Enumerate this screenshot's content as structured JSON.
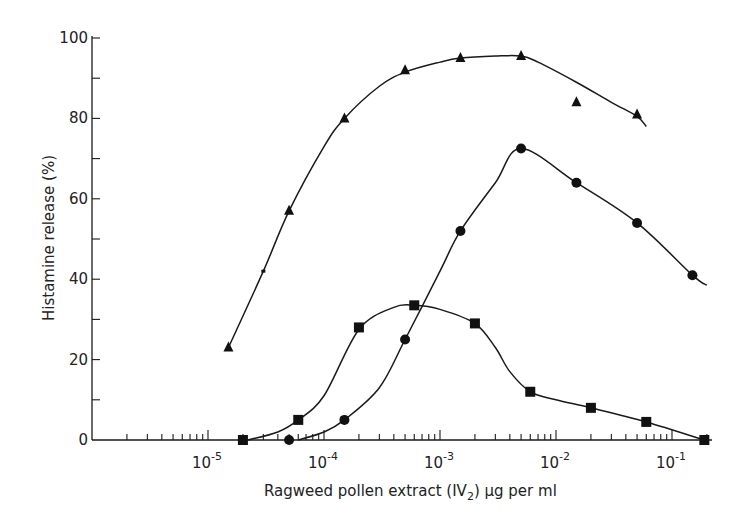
{
  "chart_data": {
    "type": "line",
    "title": "",
    "xlabel": "Ragweed pollen extract (IV2) µg per ml",
    "ylabel": "Histamine release (%)",
    "xscale": "log",
    "xlim": [
      1e-06,
      0.25
    ],
    "ylim": [
      0,
      100
    ],
    "x_ticks": [
      1e-05,
      0.0001,
      0.001,
      0.01,
      0.1
    ],
    "x_tick_labels": [
      "10-5",
      "10-4",
      "10-3",
      "10-2",
      "10-1"
    ],
    "y_ticks": [
      0,
      20,
      40,
      60,
      80,
      100
    ],
    "y_tick_labels": [
      "0",
      "20",
      "40",
      "60",
      "80",
      "100"
    ],
    "grid": false,
    "legend": null,
    "series": [
      {
        "name": "triangles",
        "marker": "triangle",
        "x": [
          1.5e-05,
          5e-05,
          0.00015,
          0.0005,
          0.0015,
          0.005,
          0.015,
          0.05
        ],
        "y": [
          23,
          57,
          80,
          92,
          95,
          95.5,
          84,
          81
        ],
        "curve": [
          [
            1.5e-05,
            23
          ],
          [
            3e-05,
            42
          ],
          [
            5e-05,
            57
          ],
          [
            0.0001,
            73
          ],
          [
            0.00015,
            80
          ],
          [
            0.0003,
            88
          ],
          [
            0.0005,
            91.5
          ],
          [
            0.001,
            94
          ],
          [
            0.0015,
            95
          ],
          [
            0.003,
            95.5
          ],
          [
            0.005,
            95.5
          ],
          [
            0.007,
            94
          ],
          [
            0.015,
            89
          ],
          [
            0.03,
            84
          ],
          [
            0.05,
            80.5
          ],
          [
            0.06,
            78
          ]
        ]
      },
      {
        "name": "circles",
        "marker": "circle",
        "x": [
          5e-05,
          0.00015,
          0.0005,
          0.0015,
          0.005,
          0.015,
          0.05,
          0.15
        ],
        "y": [
          0,
          5,
          25,
          52,
          72.5,
          64,
          54,
          41
        ],
        "curve": [
          [
            6e-05,
            0
          ],
          [
            0.0001,
            2
          ],
          [
            0.00015,
            5
          ],
          [
            0.0003,
            13
          ],
          [
            0.0005,
            25
          ],
          [
            0.001,
            42
          ],
          [
            0.0015,
            52
          ],
          [
            0.003,
            64
          ],
          [
            0.005,
            72.5
          ],
          [
            0.015,
            64
          ],
          [
            0.05,
            54
          ],
          [
            0.15,
            41
          ],
          [
            0.2,
            38.5
          ]
        ]
      },
      {
        "name": "squares",
        "marker": "square",
        "x": [
          2e-05,
          6e-05,
          0.0002,
          0.0006,
          0.002,
          0.006,
          0.02,
          0.06,
          0.19
        ],
        "y": [
          0,
          5,
          28,
          33.5,
          29,
          12,
          8,
          4.5,
          0
        ],
        "curve": [
          [
            2.2e-05,
            0
          ],
          [
            4e-05,
            2
          ],
          [
            6e-05,
            5
          ],
          [
            0.0001,
            11
          ],
          [
            0.0002,
            27.5
          ],
          [
            0.0004,
            33
          ],
          [
            0.0006,
            33.5
          ],
          [
            0.001,
            32.5
          ],
          [
            0.002,
            29
          ],
          [
            0.003,
            23
          ],
          [
            0.004,
            17
          ],
          [
            0.006,
            12
          ],
          [
            0.01,
            10
          ],
          [
            0.02,
            8
          ],
          [
            0.06,
            4.5
          ],
          [
            0.19,
            0
          ]
        ]
      }
    ],
    "annotations": [
      {
        "marker": "dot",
        "x": 3e-05,
        "y": 42
      }
    ]
  }
}
